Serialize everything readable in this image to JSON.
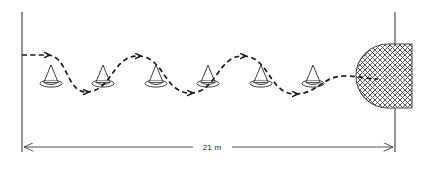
{
  "diagram": {
    "colors": {
      "line": "#3d3d3d",
      "path": "#1a1a1a",
      "cone": "#2b2b2b",
      "hatch": "#4a4a4a",
      "background": "#ffffff"
    },
    "dimension": {
      "label": "21 m",
      "value": 21,
      "unit": "m",
      "start_marker": "arrow-left",
      "end_marker": "arrow-right"
    },
    "cones": [
      {
        "index": 1,
        "label": "cone-1"
      },
      {
        "index": 2,
        "label": "cone-2"
      },
      {
        "index": 3,
        "label": "cone-3"
      },
      {
        "index": 4,
        "label": "cone-4"
      },
      {
        "index": 5,
        "label": "cone-5"
      },
      {
        "index": 6,
        "label": "cone-6"
      }
    ],
    "path": {
      "style": "dashed",
      "shape": "slalom-weave",
      "direction": "left-to-right",
      "arrow_count": 6
    },
    "target": {
      "label": "hatched-target-zone",
      "fill": "crosshatch",
      "shape": "semicircle-flat-right"
    }
  }
}
